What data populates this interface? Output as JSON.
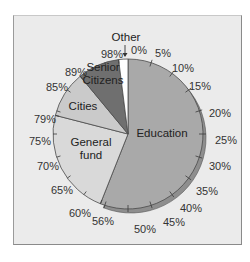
{
  "chart_data": {
    "type": "pie",
    "title": "",
    "start": "top",
    "direction": "clockwise",
    "categories": [
      "Education",
      "General fund",
      "Cities",
      "Senior Citizens",
      "Other"
    ],
    "values": [
      56,
      23,
      10,
      9,
      2
    ],
    "boundaries_percent": [
      0,
      56,
      79,
      89,
      98,
      100
    ],
    "colors": [
      "#a9a9a9",
      "#d9d9d9",
      "#cacaca",
      "#6f6f6f",
      "#ffffff"
    ],
    "rim_color": "#8e8e8e",
    "tick_step_percent": 5,
    "tick_labels": [
      "0%",
      "5%",
      "10%",
      "15%",
      "20%",
      "25%",
      "30%",
      "35%",
      "40%",
      "45%",
      "50%",
      "56%",
      "60%",
      "65%",
      "70%",
      "75%",
      "79%",
      "85%",
      "89%",
      "98%"
    ],
    "annotations": [
      {
        "text": "Other",
        "points_to": "Other slice",
        "arrow": "down"
      }
    ]
  },
  "labels": {
    "slices": [
      {
        "lines": [
          "Education"
        ],
        "x": 162,
        "y": 137
      },
      {
        "lines": [
          "General",
          "fund"
        ],
        "x": 91,
        "y": 152
      },
      {
        "lines": [
          "Cities"
        ],
        "x": 83,
        "y": 110
      },
      {
        "lines": [
          "Senior",
          "Citizens"
        ],
        "x": 103,
        "y": 77
      },
      {
        "lines": [
          "Other"
        ],
        "x": 126,
        "y": 41
      }
    ],
    "ticks": [
      {
        "text": "0%",
        "x": 139,
        "y": 54
      },
      {
        "text": "5%",
        "x": 163,
        "y": 57
      },
      {
        "text": "10%",
        "x": 183,
        "y": 72
      },
      {
        "text": "15%",
        "x": 200,
        "y": 90
      },
      {
        "text": "20%",
        "x": 220,
        "y": 117
      },
      {
        "text": "25%",
        "x": 226,
        "y": 144
      },
      {
        "text": "30%",
        "x": 220,
        "y": 170
      },
      {
        "text": "35%",
        "x": 207,
        "y": 195
      },
      {
        "text": "40%",
        "x": 191,
        "y": 212
      },
      {
        "text": "45%",
        "x": 174,
        "y": 226
      },
      {
        "text": "50%",
        "x": 145,
        "y": 233
      },
      {
        "text": "56%",
        "x": 103,
        "y": 225
      },
      {
        "text": "60%",
        "x": 80,
        "y": 217
      },
      {
        "text": "65%",
        "x": 62,
        "y": 194
      },
      {
        "text": "70%",
        "x": 48,
        "y": 170
      },
      {
        "text": "75%",
        "x": 40,
        "y": 145
      },
      {
        "text": "79%",
        "x": 45,
        "y": 123
      },
      {
        "text": "85%",
        "x": 57,
        "y": 91
      },
      {
        "text": "89%",
        "x": 76,
        "y": 76
      },
      {
        "text": "98%",
        "x": 112,
        "y": 58
      }
    ]
  }
}
